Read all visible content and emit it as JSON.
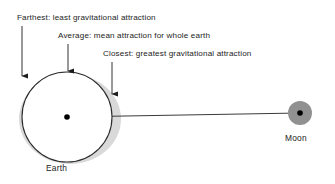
{
  "diagram": {
    "callouts": [
      {
        "id": "farthest",
        "text": "Farthest: least gravitational attraction",
        "points_to": "far-side-of-earth"
      },
      {
        "id": "average",
        "text": "Average: mean attraction for whole earth",
        "points_to": "center-of-earth"
      },
      {
        "id": "closest",
        "text": "Closest: greatest gravitational attraction",
        "points_to": "near-side-of-earth"
      }
    ],
    "bodies": [
      {
        "id": "earth",
        "label": "Earth",
        "shape": "circle-outline",
        "center": [
          67,
          117
        ],
        "radius": 45,
        "fill": "#ffffff",
        "stroke": "#2b2b2b",
        "bulge_fill": "#d9d9d9"
      },
      {
        "id": "moon",
        "label": "Moon",
        "shape": "circle-filled",
        "center": [
          300,
          113
        ],
        "radius": 12,
        "fill": "#919191",
        "center_dot": "#000000"
      }
    ],
    "connector": {
      "id": "earth-moon-line",
      "from": [
        67,
        117
      ],
      "to": [
        300,
        113
      ],
      "stroke": "#3a3a3a"
    },
    "arrows": [
      {
        "id": "arrow-farthest",
        "x": 22,
        "y_start": 26,
        "y_end": 76
      },
      {
        "id": "arrow-average",
        "x": 68,
        "y_start": 44,
        "y_end": 71
      },
      {
        "id": "arrow-closest",
        "x": 112,
        "y_start": 62,
        "y_end": 94
      }
    ],
    "colors": {
      "background": "#ffffff",
      "ink": "#1c1c1c",
      "outline": "#2b2b2b",
      "bulge_gray": "#d9d9d9",
      "moon_gray": "#919191"
    }
  }
}
